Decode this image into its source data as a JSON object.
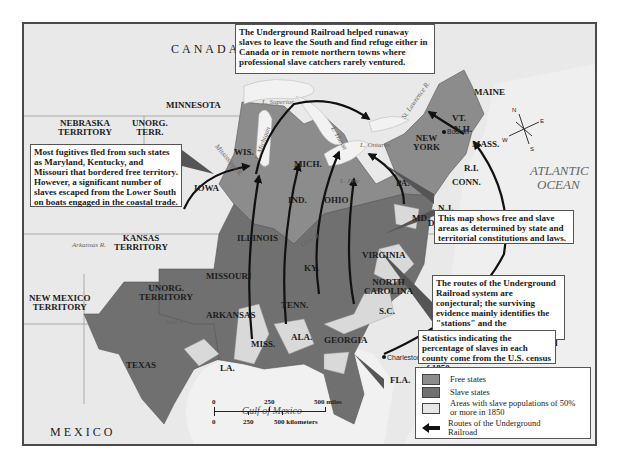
{
  "map": {
    "colors": {
      "free_states": "#8c8c8c",
      "slave_states": "#707070",
      "high_slave_areas": "#d9d9d9",
      "territory": "#e4e4e4",
      "water": "#efefef",
      "route": "#111111"
    },
    "regions": {
      "canada": "CANADA",
      "mexico": "MEXICO",
      "atlantic_1": "ATLANTIC",
      "atlantic_2": "OCEAN",
      "gulf": "Gulf of Mexico"
    },
    "territories": {
      "nebraska_1": "NEBRASKA",
      "nebraska_2": "TERRITORY",
      "unorg_terr_1": "UNORG.",
      "unorg_terr_2": "TERR.",
      "kansas_1": "KANSAS",
      "kansas_2": "TERRITORY",
      "unorg_territory_1": "UNORG.",
      "unorg_territory_2": "TERRITORY",
      "new_mexico_1": "NEW MEXICO",
      "new_mexico_2": "TERRITORY"
    },
    "states": {
      "minnesota": "MINNESOTA",
      "wisconsin": "WIS.",
      "michigan": "MICH.",
      "iowa": "IOWA",
      "illinois": "ILLINOIS",
      "indiana": "IND.",
      "ohio": "OHIO",
      "pennsylvania": "PA.",
      "new_york_1": "NEW",
      "new_york_2": "YORK",
      "vermont": "VT.",
      "new_hampshire": "N.H.",
      "maine": "MAINE",
      "massachusetts": "MASS.",
      "rhode_island": "R.I.",
      "connecticut": "CONN.",
      "new_jersey": "N.J.",
      "delaware": "DEL.",
      "maryland": "MD.",
      "virginia": "VIRGINIA",
      "north_carolina_1": "NORTH",
      "north_carolina_2": "CAROLINA",
      "south_carolina": "S.C.",
      "georgia": "GEORGIA",
      "florida": "FLA.",
      "alabama": "ALA.",
      "mississippi": "MISS.",
      "louisiana": "LA.",
      "tennessee": "TENN.",
      "kentucky": "KY.",
      "missouri": "MISSOURI",
      "arkansas": "ARKANSAS",
      "texas": "TEXAS"
    },
    "water_labels": {
      "superior": "L. Superior",
      "michigan": "L. Michigan",
      "huron": "L. Huron",
      "erie": "L. Erie",
      "ontario": "L. Ontario",
      "st_lawrence": "St. Lawrence R.",
      "mississippi": "Mississippi R.",
      "ohio": "Ohio R.",
      "arkansas": "Arkansas R.",
      "red": "Red R."
    },
    "cities": {
      "boston": "Boston",
      "charleston": "Charleston"
    },
    "compass": {
      "n": "N",
      "e": "E",
      "s": "S",
      "w": "W"
    }
  },
  "callouts": {
    "top": "The Underground Railroad helped runaway slaves to leave the South and find refuge either in Canada or in remote northern towns where professional slave catchers rarely ventured.",
    "left": "Most fugitives fled from such states as Maryland, Kentucky, and Missouri that bordered free territory. However, a significant number of slaves escaped from the Lower South on boats engaged in the coastal trade.",
    "right_1": "This map shows free and slave areas as determined by state and territorial constitutions and laws.",
    "right_2": "The routes of the Underground Railroad system are conjectural; the surviving evidence mainly identifies the \"stations\" and the \"destinations\" of the system, not the \"tracks\" that connected them.",
    "right_3": "Statistics indicating the percentage of slaves in each county come from the U.S. census of 1850."
  },
  "legend": {
    "items": [
      {
        "label": "Free states",
        "color": "#8c8c8c"
      },
      {
        "label": "Slave states",
        "color": "#707070"
      },
      {
        "label": "Areas with slave populations of 50% or more in 1850",
        "color": "#e6e6e6"
      },
      {
        "label": "Routes of the Underground Railroad",
        "icon": "arrow-left-icon"
      }
    ]
  },
  "scale_bar": {
    "miles_0": "0",
    "miles_250": "250",
    "miles_500": "500 miles",
    "km_0": "0",
    "km_250": "250",
    "km_500": "500 kilometers"
  }
}
